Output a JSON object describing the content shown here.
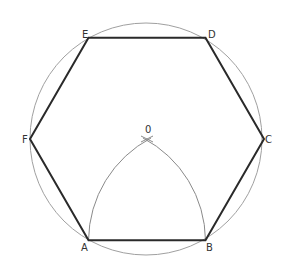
{
  "diagram": {
    "colors": {
      "hexagon": "#2a2a2a",
      "circle": "#a0a0a0",
      "arcs": "#8a8a8a",
      "labels": "#333333"
    },
    "labels": {
      "A": "A",
      "B": "B",
      "C": "C",
      "D": "D",
      "E": "E",
      "F": "F",
      "O": "0"
    },
    "construction": {
      "hexagon_order": [
        "A",
        "B",
        "C",
        "D",
        "E",
        "F"
      ],
      "arc_1": "centered at B through A, to O",
      "arc_2": "centered at A through B, to O"
    }
  }
}
